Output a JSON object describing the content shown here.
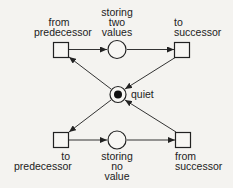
{
  "diagram": {
    "type": "petri-net",
    "transitions": [
      {
        "id": "t_from_pred",
        "label_lines": [
          "from",
          "predecessor"
        ]
      },
      {
        "id": "t_to_succ",
        "label_lines": [
          "to",
          "successor"
        ]
      },
      {
        "id": "t_to_pred",
        "label_lines": [
          "to",
          "predecessor"
        ]
      },
      {
        "id": "t_from_succ",
        "label_lines": [
          "from",
          "successor"
        ]
      }
    ],
    "places": [
      {
        "id": "p_two",
        "label_lines": [
          "storing",
          "two",
          "values"
        ],
        "tokens": 0
      },
      {
        "id": "p_quiet",
        "label_lines": [
          "quiet"
        ],
        "tokens": 1
      },
      {
        "id": "p_none",
        "label_lines": [
          "storing",
          "no",
          "value"
        ],
        "tokens": 0
      }
    ],
    "arcs": [
      [
        "t_from_pred",
        "p_two"
      ],
      [
        "p_two",
        "t_to_succ"
      ],
      [
        "t_to_succ",
        "p_quiet"
      ],
      [
        "p_quiet",
        "t_from_pred"
      ],
      [
        "p_quiet",
        "t_to_pred"
      ],
      [
        "t_from_succ",
        "p_quiet"
      ],
      [
        "t_to_pred",
        "p_none"
      ],
      [
        "p_none",
        "t_from_succ"
      ]
    ],
    "colors": {
      "stroke": "#222222",
      "background": "#f4f3f0"
    }
  }
}
